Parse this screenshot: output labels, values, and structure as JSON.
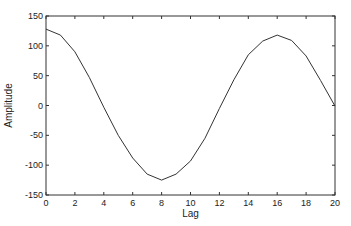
{
  "chart_data": {
    "type": "line",
    "title": "",
    "xlabel": "Lag",
    "ylabel": "Amplitude",
    "xlim": [
      0,
      20
    ],
    "ylim": [
      -150,
      150
    ],
    "xticks": [
      0,
      2,
      4,
      6,
      8,
      10,
      12,
      14,
      16,
      18,
      20
    ],
    "yticks": [
      150,
      100,
      50,
      0,
      -50,
      -100,
      -150
    ],
    "grid": false,
    "legend": null,
    "series": [
      {
        "name": "autocorrelation",
        "color": "#333333",
        "x": [
          0,
          1,
          2,
          3,
          4,
          5,
          6,
          7,
          8,
          9,
          10,
          11,
          12,
          13,
          14,
          15,
          16,
          17,
          18,
          19,
          20
        ],
        "values": [
          128,
          118,
          90,
          47,
          -3,
          -50,
          -88,
          -115,
          -125,
          -115,
          -93,
          -55,
          -5,
          43,
          85,
          108,
          118,
          109,
          83,
          42,
          -1
        ]
      }
    ]
  }
}
